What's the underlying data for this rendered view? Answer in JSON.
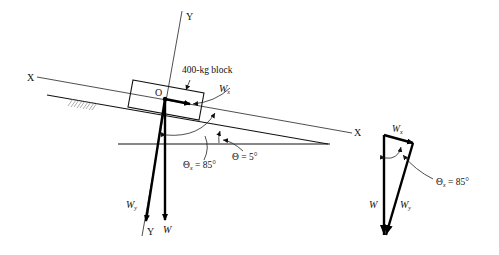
{
  "figure": {
    "block_label": "400-kg block",
    "origin_label": "O",
    "axes": {
      "x_left": "X",
      "x_right": "X",
      "y_top": "Y",
      "y_bottom": "Y"
    },
    "forces": {
      "weight": "W",
      "wx_main": "W",
      "wx_sub": "x",
      "wy_main": "W",
      "wy_sub": "y"
    },
    "angles": {
      "theta_x_main": "Θ",
      "theta_x_sub": "x",
      "theta_x_value": " = 85°",
      "theta_label": "Θ = 5°"
    },
    "triangle": {
      "wx_main": "W",
      "wx_sub": "x",
      "w": "W",
      "wy_main": "W",
      "wy_sub": "y",
      "theta_x_main": "Θ",
      "theta_x_sub": "x",
      "theta_x_value": " = 85°"
    },
    "values": {
      "mass_kg": 400,
      "incline_angle_deg": 5,
      "theta_x_deg": 85
    }
  }
}
